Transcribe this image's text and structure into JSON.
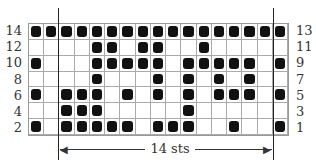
{
  "chart_data": {
    "type": "table",
    "columns": 17,
    "rows": 7,
    "left_row_labels": [
      "14",
      "12",
      "10",
      "8",
      "6",
      "4",
      "2"
    ],
    "right_row_labels": [
      "13",
      "11",
      "9",
      "7",
      "5",
      "3",
      "1"
    ],
    "cells": [
      [
        1,
        1,
        1,
        1,
        1,
        1,
        1,
        1,
        1,
        1,
        1,
        1,
        1,
        1,
        1,
        1,
        1
      ],
      [
        0,
        0,
        0,
        0,
        1,
        1,
        0,
        1,
        1,
        0,
        0,
        1,
        0,
        0,
        0,
        0,
        0
      ],
      [
        1,
        0,
        0,
        0,
        1,
        1,
        1,
        1,
        1,
        0,
        1,
        1,
        1,
        1,
        1,
        0,
        1
      ],
      [
        0,
        0,
        0,
        0,
        1,
        0,
        0,
        0,
        1,
        0,
        1,
        0,
        1,
        0,
        1,
        0,
        0
      ],
      [
        1,
        0,
        1,
        1,
        1,
        0,
        1,
        0,
        1,
        0,
        1,
        0,
        1,
        1,
        1,
        0,
        1
      ],
      [
        0,
        0,
        1,
        1,
        1,
        0,
        0,
        0,
        0,
        0,
        1,
        0,
        0,
        0,
        0,
        0,
        0
      ],
      [
        1,
        0,
        1,
        1,
        1,
        1,
        1,
        0,
        1,
        1,
        1,
        0,
        0,
        1,
        0,
        0,
        1
      ]
    ],
    "repeat": {
      "start_col": 3,
      "end_col": 16,
      "label": "14 sts"
    },
    "legend": {
      "filled": "contrast color",
      "empty": "main color"
    }
  },
  "repeat_label": "14 sts"
}
